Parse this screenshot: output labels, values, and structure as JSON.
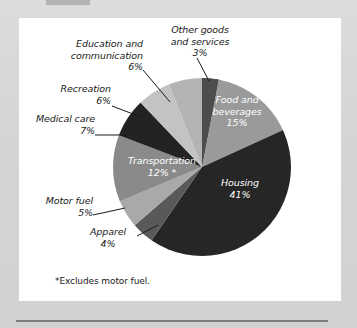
{
  "figure": {
    "footnote": "*Excludes motor fuel."
  },
  "chart_data": {
    "type": "pie",
    "title": "",
    "start_angle_deg": 0,
    "direction": "clockwise",
    "center": [
      202,
      168
    ],
    "radius": 89,
    "units": "percent",
    "categories": [
      "Other goods and services",
      "Food and beverages",
      "Housing",
      "Apparel",
      "Motor fuel",
      "Transportation",
      "Medical care",
      "Recreation",
      "Education and communication"
    ],
    "values": [
      3,
      15,
      41,
      4,
      5,
      12,
      7,
      6,
      6
    ],
    "colors": [
      "#4d4d4d",
      "#9a9a9a",
      "#262626",
      "#595959",
      "#a9a9a9",
      "#8a8a8a",
      "#232323",
      "#c3c3c3",
      "#b4b4b4"
    ],
    "slices": [
      {
        "label": "Other goods\nand services",
        "value_label": "3%",
        "placement": "outside",
        "color": "#4d4d4d"
      },
      {
        "label": "Food and\nbeverages",
        "value_label": "15%",
        "placement": "inside",
        "color": "#9a9a9a"
      },
      {
        "label": "Housing",
        "value_label": "41%",
        "placement": "inside",
        "color": "#262626"
      },
      {
        "label": "Apparel",
        "value_label": "4%",
        "placement": "outside",
        "color": "#595959"
      },
      {
        "label": "Motor fuel",
        "value_label": "5%",
        "placement": "outside",
        "color": "#a9a9a9"
      },
      {
        "label": "Transportation",
        "value_label": "12% *",
        "placement": "inside",
        "color": "#8a8a8a"
      },
      {
        "label": "Medical care",
        "value_label": "7%",
        "placement": "outside",
        "color": "#232323"
      },
      {
        "label": "Recreation",
        "value_label": "6%",
        "placement": "outside",
        "color": "#c3c3c3"
      },
      {
        "label": "Education and\ncommunication",
        "value_label": "6%",
        "placement": "outside",
        "color": "#b4b4b4"
      }
    ],
    "legend": "none",
    "grid": false,
    "annotations": [
      "*Excludes motor fuel."
    ]
  },
  "labels": {
    "other_goods": "Other goods\nand services\n3%",
    "education": "Education and\ncommunication\n6%",
    "recreation": "Recreation\n6%",
    "medical_care": "Medical care\n7%",
    "motor_fuel": "Motor fuel\n5%",
    "apparel": "Apparel\n4%",
    "food_beverages": "Food and\nbeverages\n15%",
    "housing": "Housing\n41%",
    "transportation": "Transportation\n12% *"
  }
}
